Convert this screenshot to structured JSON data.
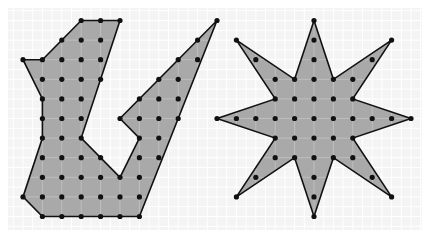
{
  "grid": {
    "columns": 21,
    "rows": 11
  },
  "colors": {
    "background": "#ffffff",
    "panel": "#f4f4f4",
    "panel_line": "#ffffff",
    "fill": "#a9a9a9",
    "fill_line": "#c4c4c4",
    "edge": "#111111",
    "dot": "#111111"
  },
  "shapes": [
    {
      "name": "irregular-v-polygon",
      "vertices": [
        [
          3,
          0
        ],
        [
          5,
          0
        ],
        [
          3,
          6
        ],
        [
          5,
          8
        ],
        [
          6,
          6
        ],
        [
          5,
          5
        ],
        [
          10,
          0
        ],
        [
          6,
          10
        ],
        [
          1,
          10
        ],
        [
          0,
          9
        ],
        [
          1,
          6
        ],
        [
          1,
          4
        ],
        [
          0,
          2
        ],
        [
          1,
          2
        ]
      ]
    },
    {
      "name": "eight-point-star",
      "vertices": [
        [
          15,
          0
        ],
        [
          16,
          3
        ],
        [
          19,
          1
        ],
        [
          17,
          4
        ],
        [
          20,
          5
        ],
        [
          17,
          6
        ],
        [
          19,
          9
        ],
        [
          16,
          7
        ],
        [
          15,
          10
        ],
        [
          14,
          7
        ],
        [
          11,
          9
        ],
        [
          13,
          6
        ],
        [
          10,
          5
        ],
        [
          13,
          4
        ],
        [
          11,
          1
        ],
        [
          14,
          3
        ]
      ]
    }
  ]
}
